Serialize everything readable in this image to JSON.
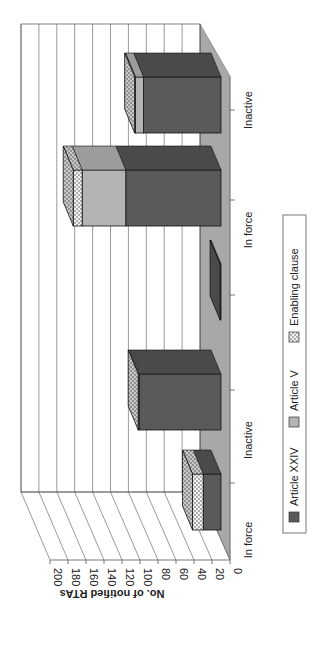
{
  "chart_data": {
    "type": "bar",
    "subtype": "3d-stacked-bar",
    "orientation_note": "figure rotated 90 degrees clockwise",
    "title": "",
    "xlabel": "",
    "ylabel": "No. of notified RTAs",
    "ylim": [
      0,
      200
    ],
    "yticks": [
      0,
      20,
      40,
      60,
      80,
      100,
      120,
      140,
      160,
      180,
      200
    ],
    "grid": true,
    "legend_position": "bottom",
    "categories": [
      "In force",
      "Inactive",
      "In force",
      "Inactive",
      "In force",
      "Inactive"
    ],
    "series": [
      {
        "name": "Article XXIV",
        "color": "#5a5a5a",
        "pattern": "solid",
        "values": [
          20,
          92,
          1,
          0,
          107,
          87
        ]
      },
      {
        "name": "Article V",
        "color": "#b4b4b4",
        "pattern": "solid",
        "values": [
          0,
          0,
          0,
          0,
          49,
          9
        ]
      },
      {
        "name": "Enabling clause",
        "color": "#e8e8e8",
        "pattern": "dots",
        "values": [
          12,
          1,
          0,
          0,
          10,
          1
        ]
      }
    ]
  },
  "axis": {
    "ylabel": "No. of notified RTAs",
    "ticks": [
      "0",
      "20",
      "40",
      "60",
      "80",
      "100",
      "120",
      "140",
      "160",
      "180",
      "200"
    ]
  },
  "categories": {
    "labels": [
      "In force",
      "Inactive",
      "In force",
      "Inactive",
      "In force",
      "Inactive"
    ]
  },
  "legend": {
    "items": [
      {
        "label": "Article XXIV",
        "color": "#5a5a5a"
      },
      {
        "label": "Article V",
        "color": "#b4b4b4"
      },
      {
        "label": "Enabling clause",
        "color": "#e8e8e8"
      }
    ]
  },
  "colors": {
    "floor": "#a8a8a8",
    "grid": "#555555",
    "wall": "#ffffff"
  }
}
